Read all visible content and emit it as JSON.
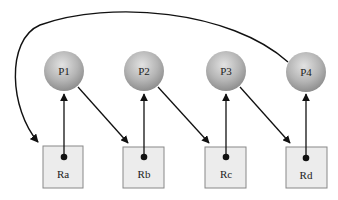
{
  "diagram": {
    "title": "",
    "processes": [
      {
        "id": "P1",
        "label": "P1"
      },
      {
        "id": "P2",
        "label": "P2"
      },
      {
        "id": "P3",
        "label": "P3"
      },
      {
        "id": "P4",
        "label": "P4"
      }
    ],
    "resources": [
      {
        "id": "Ra",
        "label": "Ra"
      },
      {
        "id": "Rb",
        "label": "Rb"
      },
      {
        "id": "Rc",
        "label": "Rc"
      },
      {
        "id": "Rd",
        "label": "Rd"
      }
    ],
    "edges": [
      {
        "from": "Ra",
        "to": "P1",
        "type": "assignment"
      },
      {
        "from": "Rb",
        "to": "P2",
        "type": "assignment"
      },
      {
        "from": "Rc",
        "to": "P3",
        "type": "assignment"
      },
      {
        "from": "Rd",
        "to": "P4",
        "type": "assignment"
      },
      {
        "from": "P1",
        "to": "Rb",
        "type": "request"
      },
      {
        "from": "P2",
        "to": "Rc",
        "type": "request"
      },
      {
        "from": "P3",
        "to": "Rd",
        "type": "request"
      },
      {
        "from": "P4",
        "to": "Ra",
        "type": "request"
      }
    ],
    "colors": {
      "process_fill_light": "#d8d8d8",
      "process_fill_dark": "#9a9a9a",
      "resource_fill": "#ececec",
      "resource_border": "#888888",
      "edge": "#111111"
    }
  }
}
